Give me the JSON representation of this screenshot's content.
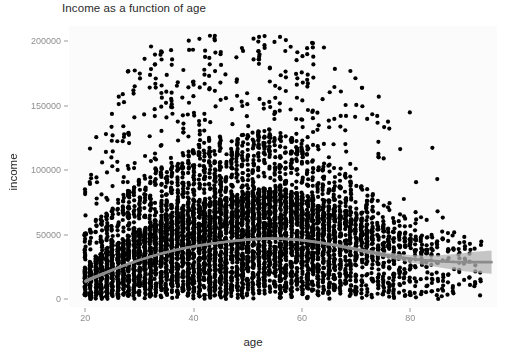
{
  "chart_data": {
    "type": "scatter",
    "title": "Income as a function of age",
    "xlabel": "age",
    "ylabel": "income",
    "xlim": [
      17,
      96
    ],
    "ylim": [
      -6000,
      212000
    ],
    "xticks": [
      20,
      40,
      60,
      80
    ],
    "xtick_labels": [
      "20",
      "40",
      "60",
      "80"
    ],
    "yticks": [
      0,
      50000,
      100000,
      150000,
      200000
    ],
    "ytick_labels": [
      "0",
      "50000",
      "100000",
      "150000",
      "200000"
    ],
    "grid": false,
    "legend": null,
    "point_color": "#000000",
    "point_size": 2.1,
    "panel_background": "#fbfbfb",
    "axis_text_color": "#8f8f8f",
    "title_color": "#2b2b2b",
    "smooth": {
      "name": "loess smooth",
      "line_color": "#8c8c8c",
      "band_color": "#b3b3b3",
      "x": [
        20,
        24,
        28,
        32,
        36,
        40,
        44,
        48,
        52,
        56,
        60,
        64,
        68,
        72,
        76,
        80,
        84,
        88,
        92,
        95
      ],
      "y": [
        14000,
        21000,
        27500,
        33000,
        37500,
        41000,
        43500,
        45500,
        46800,
        47000,
        45800,
        43500,
        40500,
        37000,
        34000,
        31500,
        29800,
        29000,
        28800,
        28800
      ],
      "band_halfwidth": [
        1600,
        1200,
        1000,
        900,
        850,
        850,
        850,
        900,
        900,
        950,
        1000,
        1100,
        1300,
        1600,
        2100,
        2900,
        4200,
        6000,
        8000,
        9000
      ]
    },
    "series": [
      {
        "name": "individuals",
        "n_points": 5200,
        "description": "one point per individual; age on x, annual income on y; dense near-continuous column of points for every integer age between 20 and 92, with income concentrated below 50000 and a long sparse upper tail reaching 205000",
        "density_by_age": [
          {
            "age": 20,
            "count": 62,
            "median": 14000,
            "p90": 52000,
            "max": 100000
          },
          {
            "age": 22,
            "count": 78,
            "median": 18000,
            "p90": 62000,
            "max": 142000
          },
          {
            "age": 25,
            "count": 92,
            "median": 23000,
            "p90": 74000,
            "max": 150000
          },
          {
            "age": 28,
            "count": 104,
            "median": 27000,
            "p90": 86000,
            "max": 185000
          },
          {
            "age": 31,
            "count": 112,
            "median": 31000,
            "p90": 95000,
            "max": 196000
          },
          {
            "age": 34,
            "count": 120,
            "median": 35000,
            "p90": 104000,
            "max": 200000
          },
          {
            "age": 37,
            "count": 126,
            "median": 38000,
            "p90": 112000,
            "max": 205000
          },
          {
            "age": 40,
            "count": 132,
            "median": 40000,
            "p90": 118000,
            "max": 205000
          },
          {
            "age": 44,
            "count": 136,
            "median": 43000,
            "p90": 124000,
            "max": 205000
          },
          {
            "age": 48,
            "count": 138,
            "median": 45000,
            "p90": 128000,
            "max": 205000
          },
          {
            "age": 52,
            "count": 136,
            "median": 46500,
            "p90": 130000,
            "max": 205000
          },
          {
            "age": 56,
            "count": 128,
            "median": 46500,
            "p90": 128000,
            "max": 205000
          },
          {
            "age": 60,
            "count": 116,
            "median": 45000,
            "p90": 122000,
            "max": 202000
          },
          {
            "age": 64,
            "count": 98,
            "median": 42000,
            "p90": 112000,
            "max": 198000
          },
          {
            "age": 68,
            "count": 72,
            "median": 38000,
            "p90": 98000,
            "max": 190000
          },
          {
            "age": 72,
            "count": 52,
            "median": 34000,
            "p90": 86000,
            "max": 175000
          },
          {
            "age": 76,
            "count": 36,
            "median": 31000,
            "p90": 74000,
            "max": 160000
          },
          {
            "age": 80,
            "count": 24,
            "median": 29000,
            "p90": 66000,
            "max": 148000
          },
          {
            "age": 84,
            "count": 16,
            "median": 28000,
            "p90": 60000,
            "max": 130000
          },
          {
            "age": 88,
            "count": 10,
            "median": 27000,
            "p90": 54000,
            "max": 100000
          },
          {
            "age": 92,
            "count": 6,
            "median": 27000,
            "p90": 48000,
            "max": 62000
          }
        ]
      }
    ]
  }
}
